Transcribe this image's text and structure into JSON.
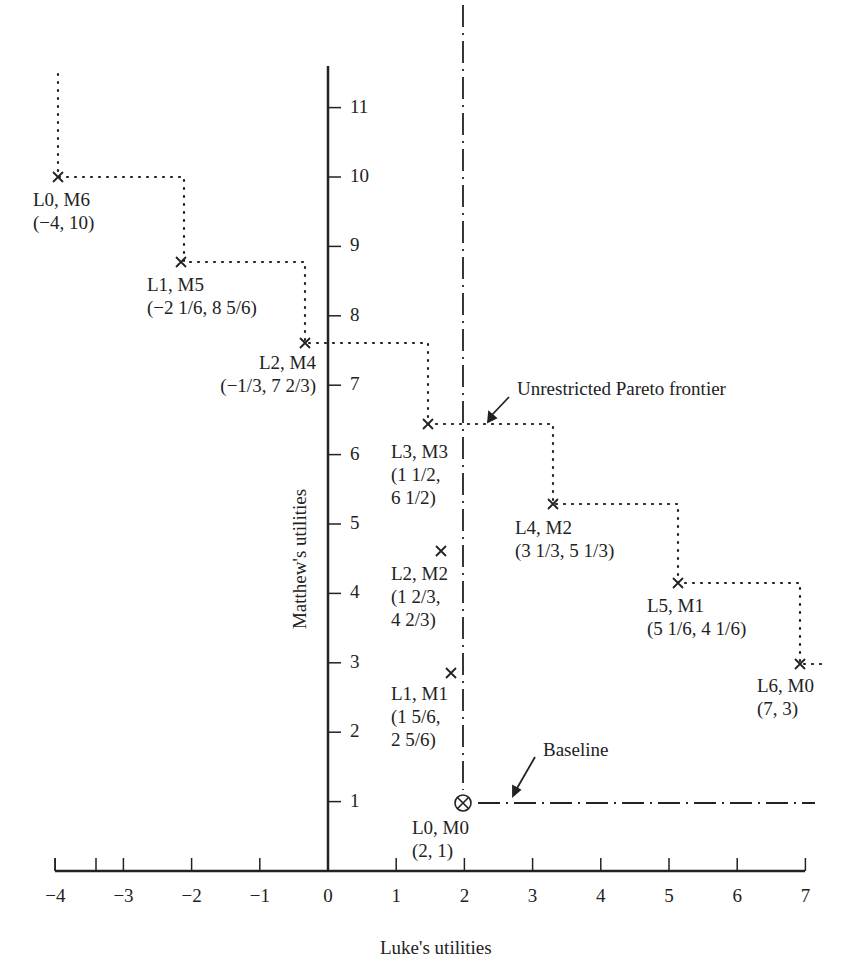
{
  "chart_data": {
    "type": "scatter",
    "title": "",
    "xlabel": "Luke's utilities",
    "ylabel": "Matthew's utilities",
    "xlim": [
      -4,
      7
    ],
    "ylim": [
      0,
      11.5
    ],
    "x_ticks": [
      "−4",
      "−3",
      "−2",
      "−1",
      "0",
      "1",
      "2",
      "3",
      "4",
      "5",
      "6",
      "7"
    ],
    "y_ticks": [
      "1",
      "2",
      "3",
      "4",
      "5",
      "6",
      "7",
      "8",
      "9",
      "10",
      "11"
    ],
    "grid": false,
    "points": [
      {
        "label": "L0, M6",
        "coords": "(−4, 10)",
        "x": -4,
        "y": 10,
        "frontier": true
      },
      {
        "label": "L1, M5",
        "coords": "(−2 1/6, 8 5/6)",
        "x": -2.1667,
        "y": 8.8333,
        "frontier": true
      },
      {
        "label": "L2, M4",
        "coords": "(−1/3, 7 2/3)",
        "x": -0.3333,
        "y": 7.6667,
        "frontier": true
      },
      {
        "label": "L3, M3",
        "coords": "(1 1/2,\n6 1/2)",
        "x": 1.5,
        "y": 6.5,
        "frontier": true
      },
      {
        "label": "L4, M2",
        "coords": "(3 1/3, 5 1/3)",
        "x": 3.3333,
        "y": 5.3333,
        "frontier": true
      },
      {
        "label": "L5, M1",
        "coords": "(5 1/6, 4 1/6)",
        "x": 5.1667,
        "y": 4.1667,
        "frontier": true
      },
      {
        "label": "L6, M0",
        "coords": "(7, 3)",
        "x": 7,
        "y": 3,
        "frontier": true
      },
      {
        "label": "L2, M2",
        "coords": "(1 2/3,\n4 2/3)",
        "x": 1.6667,
        "y": 4.6667,
        "frontier": false
      },
      {
        "label": "L1, M1",
        "coords": "(1 5/6,\n2 5/6)",
        "x": 1.8333,
        "y": 2.8333,
        "frontier": false
      },
      {
        "label": "L0, M0",
        "coords": "(2, 1)",
        "x": 2,
        "y": 1,
        "frontier": false,
        "baseline": true
      }
    ],
    "annotations": [
      {
        "text": "Unrestricted Pareto frontier"
      },
      {
        "text": "Baseline"
      }
    ]
  },
  "labels": {
    "xlabel": "Luke's utilities",
    "ylabel": "Matthew's utilities",
    "pareto": "Unrestricted Pareto frontier",
    "baseline": "Baseline",
    "p0": "L0, M6\n(−4, 10)",
    "p1": "L1, M5\n(−2 1/6, 8 5/6)",
    "p2": "L2, M4\n(−1/3, 7 2/3)",
    "p3": "L3, M3\n(1 1/2,\n6 1/2)",
    "p4": "L4, M2\n(3 1/3, 5 1/3)",
    "p5": "L5, M1\n(5 1/6, 4 1/6)",
    "p6": "L6, M0\n(7, 3)",
    "q1": "L2, M2\n(1 2/3,\n4 2/3)",
    "q2": "L1, M1\n(1 5/6,\n2 5/6)",
    "q3": "L0, M0\n(2, 1)"
  },
  "ticks": {
    "x": [
      "−4",
      "−3",
      "−2",
      "−1",
      "0",
      "1",
      "2",
      "3",
      "4",
      "5",
      "6",
      "7"
    ],
    "y": [
      "1",
      "2",
      "3",
      "4",
      "5",
      "6",
      "7",
      "8",
      "9",
      "10",
      "11"
    ]
  }
}
